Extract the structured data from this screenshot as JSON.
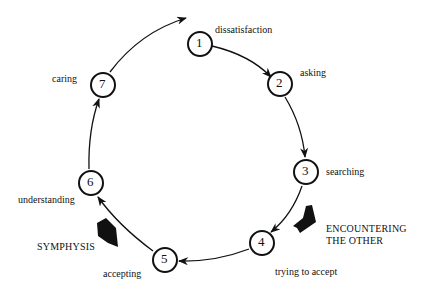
{
  "diagram": {
    "type": "cycle",
    "nodes": [
      {
        "id": "1",
        "label": "dissatisfaction"
      },
      {
        "id": "2",
        "label": "asking"
      },
      {
        "id": "3",
        "label": "searching"
      },
      {
        "id": "4",
        "label": "trying to accept"
      },
      {
        "id": "5",
        "label": "accepting"
      },
      {
        "id": "6",
        "label": "understanding"
      },
      {
        "id": "7",
        "label": "caring"
      }
    ],
    "external_arrows": [
      {
        "label_line1": "ENCOUNTERING",
        "label_line2": "THE OTHER",
        "points_to": "4"
      },
      {
        "label": "SYMPHYSIS",
        "points_from": "5-6 arc"
      }
    ],
    "colors": {
      "stroke": "#111111",
      "background": "#ffffff"
    }
  }
}
